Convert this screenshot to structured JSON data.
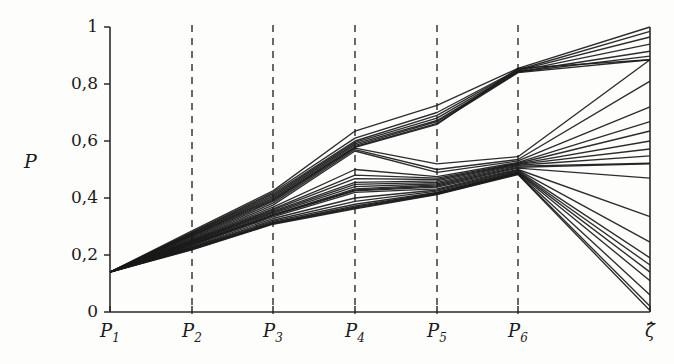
{
  "chart_data": {
    "type": "line",
    "subtype": "parallel-coordinates",
    "title": "",
    "xlabel": "",
    "ylabel": "P",
    "ylim": [
      0,
      1
    ],
    "grid": "dashed vertical gridlines at P2..P6",
    "legend": "none",
    "axis_color": "#2a2a2a",
    "line_color": "#1a1a1a",
    "background_color": "#fdfdfb",
    "categories": [
      "P_1",
      "P_2",
      "P_3",
      "P_4",
      "P_5",
      "P_6",
      "zeta_hat"
    ],
    "x_tick_labels": [
      "P",
      "P",
      "P",
      "P",
      "P",
      "P",
      "ζ̂"
    ],
    "x_tick_subscripts": [
      "1",
      "2",
      "3",
      "4",
      "5",
      "6",
      ""
    ],
    "y_tick_labels": [
      "0",
      "0,2",
      "0,4",
      "0,6",
      "0,8",
      "1"
    ],
    "y_tick_values": [
      0,
      0.2,
      0.4,
      0.6,
      0.8,
      1
    ],
    "series": [
      {
        "name": "s1",
        "values": [
          0.14,
          0.285,
          0.425,
          0.635,
          0.725,
          0.855,
          1.0
        ]
      },
      {
        "name": "s2",
        "values": [
          0.14,
          0.28,
          0.42,
          0.61,
          0.7,
          0.85,
          0.985
        ]
      },
      {
        "name": "s3",
        "values": [
          0.14,
          0.278,
          0.415,
          0.6,
          0.69,
          0.848,
          0.965
        ]
      },
      {
        "name": "s4",
        "values": [
          0.14,
          0.275,
          0.41,
          0.595,
          0.68,
          0.845,
          0.94
        ]
      },
      {
        "name": "s5",
        "values": [
          0.14,
          0.272,
          0.405,
          0.59,
          0.672,
          0.843,
          0.915
        ]
      },
      {
        "name": "s6",
        "values": [
          0.14,
          0.27,
          0.4,
          0.585,
          0.668,
          0.842,
          0.898
        ]
      },
      {
        "name": "s7",
        "values": [
          0.14,
          0.268,
          0.396,
          0.58,
          0.662,
          0.84,
          0.885
        ]
      },
      {
        "name": "s8",
        "values": [
          0.14,
          0.265,
          0.392,
          0.578,
          0.658,
          0.855,
          0.885
        ]
      },
      {
        "name": "s9",
        "values": [
          0.14,
          0.262,
          0.388,
          0.575,
          0.52,
          0.545,
          0.885
        ]
      },
      {
        "name": "s10",
        "values": [
          0.14,
          0.258,
          0.382,
          0.57,
          0.5,
          0.535,
          0.81
        ]
      },
      {
        "name": "s11",
        "values": [
          0.14,
          0.255,
          0.375,
          0.565,
          0.49,
          0.53,
          0.72
        ]
      },
      {
        "name": "s12",
        "values": [
          0.14,
          0.252,
          0.368,
          0.5,
          0.475,
          0.525,
          0.668
        ]
      },
      {
        "name": "s13",
        "values": [
          0.14,
          0.25,
          0.362,
          0.48,
          0.47,
          0.522,
          0.635
        ]
      },
      {
        "name": "s14",
        "values": [
          0.14,
          0.248,
          0.358,
          0.468,
          0.465,
          0.52,
          0.6
        ]
      },
      {
        "name": "s15",
        "values": [
          0.14,
          0.246,
          0.354,
          0.455,
          0.46,
          0.518,
          0.572
        ]
      },
      {
        "name": "s16",
        "values": [
          0.14,
          0.244,
          0.35,
          0.448,
          0.455,
          0.515,
          0.548
        ]
      },
      {
        "name": "s17",
        "values": [
          0.14,
          0.242,
          0.346,
          0.44,
          0.45,
          0.512,
          0.522
        ]
      },
      {
        "name": "s18",
        "values": [
          0.14,
          0.24,
          0.342,
          0.432,
          0.446,
          0.508,
          0.52
        ]
      },
      {
        "name": "s19",
        "values": [
          0.14,
          0.238,
          0.34,
          0.428,
          0.442,
          0.505,
          0.47
        ]
      },
      {
        "name": "s20",
        "values": [
          0.14,
          0.236,
          0.338,
          0.425,
          0.438,
          0.5,
          0.335
        ]
      },
      {
        "name": "s21",
        "values": [
          0.14,
          0.234,
          0.334,
          0.42,
          0.432,
          0.498,
          0.245
        ]
      },
      {
        "name": "s22",
        "values": [
          0.14,
          0.23,
          0.328,
          0.4,
          0.428,
          0.495,
          0.19
        ]
      },
      {
        "name": "s23",
        "values": [
          0.14,
          0.228,
          0.322,
          0.388,
          0.424,
          0.492,
          0.165
        ]
      },
      {
        "name": "s24",
        "values": [
          0.14,
          0.226,
          0.318,
          0.378,
          0.42,
          0.49,
          0.14
        ]
      },
      {
        "name": "s25",
        "values": [
          0.14,
          0.224,
          0.314,
          0.372,
          0.418,
          0.488,
          0.11
        ]
      },
      {
        "name": "s26",
        "values": [
          0.14,
          0.222,
          0.312,
          0.368,
          0.416,
          0.486,
          0.06
        ]
      },
      {
        "name": "s27",
        "values": [
          0.14,
          0.22,
          0.31,
          0.365,
          0.414,
          0.484,
          0.02
        ]
      },
      {
        "name": "s28",
        "values": [
          0.14,
          0.218,
          0.308,
          0.362,
          0.412,
          0.482,
          0.005
        ]
      }
    ]
  }
}
